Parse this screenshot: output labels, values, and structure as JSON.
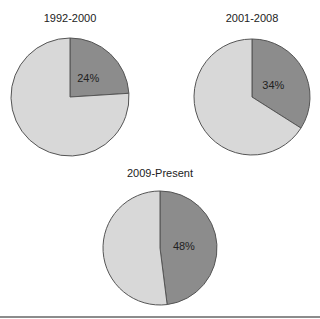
{
  "chart_data": [
    {
      "type": "pie",
      "title": "1992-2000",
      "slices": [
        {
          "label": "24%",
          "value": 24,
          "color": "#8c8c8c"
        },
        {
          "label": "",
          "value": 76,
          "color": "#d8d8d8"
        }
      ]
    },
    {
      "type": "pie",
      "title": "2001-2008",
      "slices": [
        {
          "label": "34%",
          "value": 34,
          "color": "#8c8c8c"
        },
        {
          "label": "",
          "value": 66,
          "color": "#d8d8d8"
        }
      ]
    },
    {
      "type": "pie",
      "title": "2009-Present",
      "slices": [
        {
          "label": "48%",
          "value": 48,
          "color": "#8c8c8c"
        },
        {
          "label": "",
          "value": 52,
          "color": "#d8d8d8"
        }
      ]
    }
  ],
  "layout": {
    "pies": [
      {
        "cx": 70,
        "cy": 97,
        "r": 59,
        "title_y": 12
      },
      {
        "cx": 252,
        "cy": 97,
        "r": 58,
        "title_y": 12
      },
      {
        "cx": 160,
        "cy": 248,
        "r": 57,
        "title_y": 167
      }
    ]
  }
}
